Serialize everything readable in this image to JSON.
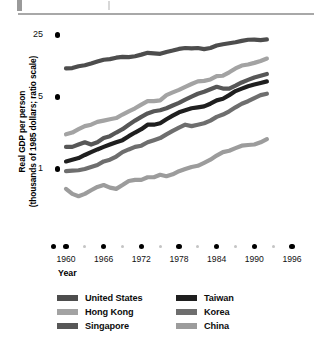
{
  "chart_data": {
    "type": "line",
    "title": "",
    "xlabel": "Year",
    "ylabel": "Real GDP per person\n(thousands of 1985 dollars; ratio scale)",
    "scale": "log",
    "grid": false,
    "legend_position": "bottom",
    "xlim": [
      1958,
      1996
    ],
    "ylim": [
      0.4,
      32
    ],
    "x_ticks": [
      1960,
      1966,
      1972,
      1978,
      1984,
      1990,
      1996
    ],
    "x_tick_labels": [
      "1960",
      "1966",
      "1972",
      "1978",
      "1984",
      "1990",
      "1996"
    ],
    "y_ticks": [
      1,
      5,
      25
    ],
    "y_tick_labels": [
      "1",
      "5",
      "25"
    ],
    "x": [
      1960,
      1961,
      1962,
      1963,
      1964,
      1965,
      1966,
      1967,
      1968,
      1969,
      1970,
      1971,
      1972,
      1973,
      1974,
      1975,
      1976,
      1977,
      1978,
      1979,
      1980,
      1981,
      1982,
      1983,
      1984,
      1985,
      1986,
      1987,
      1988,
      1989,
      1990,
      1991,
      1992
    ],
    "series": [
      {
        "name": "United States",
        "color": "#4d4d4d",
        "values": [
          11.2,
          11.3,
          11.8,
          12.1,
          12.6,
          13.2,
          13.8,
          14.0,
          14.5,
          14.8,
          14.7,
          15.0,
          15.6,
          16.3,
          16.1,
          15.9,
          16.6,
          17.2,
          17.9,
          18.3,
          18.1,
          18.3,
          17.8,
          18.3,
          19.4,
          20.0,
          20.5,
          21.0,
          21.7,
          22.3,
          22.4,
          22.1,
          22.5
        ]
      },
      {
        "name": "Hong Kong",
        "color": "#a3a3a3",
        "values": [
          2.3,
          2.4,
          2.6,
          2.8,
          2.9,
          3.1,
          3.2,
          3.3,
          3.4,
          3.7,
          4.0,
          4.3,
          4.7,
          5.1,
          5.1,
          5.2,
          5.9,
          6.3,
          6.7,
          7.2,
          7.7,
          8.2,
          8.3,
          8.6,
          9.3,
          9.4,
          10.2,
          11.2,
          12.0,
          12.3,
          12.8,
          13.4,
          14.2
        ]
      },
      {
        "name": "Singapore",
        "color": "#575757",
        "values": [
          1.7,
          1.7,
          1.8,
          1.9,
          1.8,
          1.9,
          2.1,
          2.2,
          2.4,
          2.6,
          2.9,
          3.2,
          3.5,
          3.8,
          4.0,
          4.1,
          4.3,
          4.6,
          4.9,
          5.3,
          5.7,
          6.1,
          6.4,
          6.8,
          7.2,
          6.9,
          6.9,
          7.4,
          8.0,
          8.5,
          9.0,
          9.4,
          9.8
        ]
      },
      {
        "name": "Taiwan",
        "color": "#1f1f1f",
        "values": [
          1.2,
          1.25,
          1.3,
          1.4,
          1.5,
          1.6,
          1.7,
          1.8,
          1.9,
          2.0,
          2.2,
          2.4,
          2.6,
          2.9,
          2.9,
          3.0,
          3.3,
          3.6,
          3.9,
          4.1,
          4.3,
          4.4,
          4.5,
          4.8,
          5.2,
          5.4,
          5.9,
          6.5,
          6.9,
          7.3,
          7.6,
          7.9,
          8.2
        ]
      },
      {
        "name": "Korea",
        "color": "#6e6e6e",
        "values": [
          0.95,
          0.96,
          0.97,
          1.0,
          1.05,
          1.1,
          1.2,
          1.25,
          1.35,
          1.5,
          1.6,
          1.7,
          1.75,
          1.9,
          2.0,
          2.1,
          2.3,
          2.5,
          2.7,
          2.9,
          2.8,
          2.9,
          3.0,
          3.2,
          3.5,
          3.7,
          4.0,
          4.4,
          4.8,
          5.1,
          5.5,
          5.9,
          6.1
        ]
      },
      {
        "name": "China",
        "color": "#9c9c9c",
        "values": [
          0.62,
          0.55,
          0.52,
          0.55,
          0.6,
          0.65,
          0.68,
          0.64,
          0.62,
          0.68,
          0.75,
          0.77,
          0.77,
          0.82,
          0.82,
          0.87,
          0.84,
          0.88,
          0.95,
          1.0,
          1.05,
          1.08,
          1.16,
          1.25,
          1.38,
          1.5,
          1.55,
          1.65,
          1.75,
          1.78,
          1.8,
          1.9,
          2.05
        ]
      }
    ]
  },
  "axes": {
    "y_title": "Real GDP per person\n(thousands of 1985 dollars; ratio scale)",
    "x_title": "Year",
    "y_labels": [
      "25",
      "5",
      "1"
    ],
    "x_labels": [
      "1960",
      "1966",
      "1972",
      "1978",
      "1984",
      "1990",
      "1996"
    ]
  },
  "legend": {
    "left": [
      {
        "label": "United States",
        "color": "#4d4d4d"
      },
      {
        "label": "Hong Kong",
        "color": "#a3a3a3"
      },
      {
        "label": "Singapore",
        "color": "#575757"
      }
    ],
    "right": [
      {
        "label": "Taiwan",
        "color": "#1f1f1f"
      },
      {
        "label": "Korea",
        "color": "#6e6e6e"
      },
      {
        "label": "China",
        "color": "#9c9c9c"
      }
    ]
  }
}
